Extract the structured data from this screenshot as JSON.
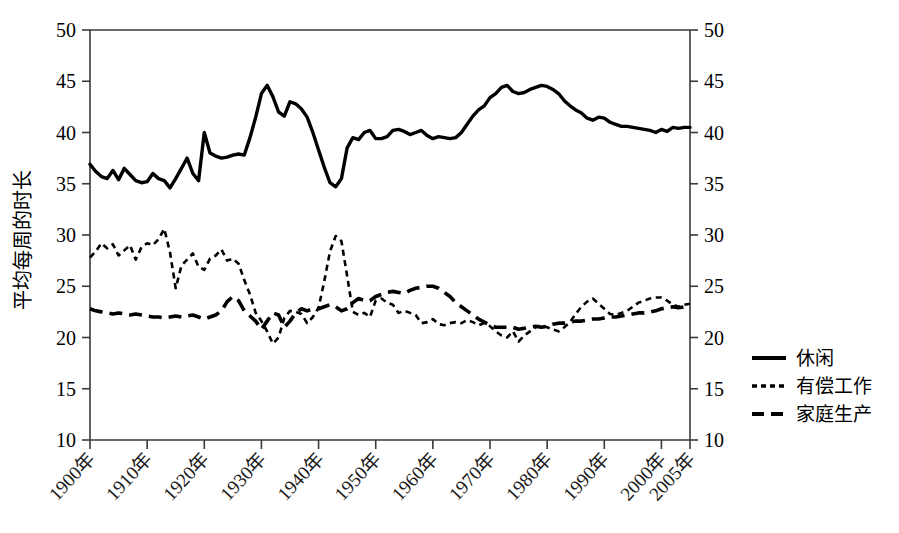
{
  "chart_data": {
    "type": "line",
    "title": "",
    "xlabel": "",
    "ylabel": "平均每周的时长",
    "ylim": [
      10,
      50
    ],
    "xlim": [
      1900,
      2005
    ],
    "y_ticks": [
      10,
      15,
      20,
      25,
      30,
      35,
      40,
      45,
      50
    ],
    "y_tick_labels_left": [
      "10",
      "15",
      "20",
      "25",
      "30",
      "35",
      "40",
      "45",
      "50"
    ],
    "y_tick_labels_right": [
      "10",
      "15",
      "20",
      "25",
      "30",
      "35",
      "40",
      "45",
      "50"
    ],
    "x_ticks": [
      1900,
      1910,
      1920,
      1930,
      1940,
      1950,
      1960,
      1970,
      1980,
      1990,
      2000,
      2005
    ],
    "x_tick_labels": [
      "1900年",
      "1910年",
      "1920年",
      "1930年",
      "1940年",
      "1950年",
      "1960年",
      "1970年",
      "1980年",
      "1990年",
      "2000年",
      "2005年"
    ],
    "grid": false,
    "dual_y_axis": true,
    "legend_position": "right",
    "series": [
      {
        "name": "休闲",
        "style": "solid",
        "x": [
          1900,
          1901,
          1902,
          1903,
          1904,
          1905,
          1906,
          1907,
          1908,
          1909,
          1910,
          1911,
          1912,
          1913,
          1914,
          1915,
          1916,
          1917,
          1918,
          1919,
          1920,
          1921,
          1922,
          1923,
          1924,
          1925,
          1926,
          1927,
          1928,
          1929,
          1930,
          1931,
          1932,
          1933,
          1934,
          1935,
          1936,
          1937,
          1938,
          1939,
          1940,
          1941,
          1942,
          1943,
          1944,
          1945,
          1946,
          1947,
          1948,
          1949,
          1950,
          1951,
          1952,
          1953,
          1954,
          1955,
          1956,
          1957,
          1958,
          1959,
          1960,
          1961,
          1962,
          1963,
          1964,
          1965,
          1966,
          1967,
          1968,
          1969,
          1970,
          1971,
          1972,
          1973,
          1974,
          1975,
          1976,
          1977,
          1978,
          1979,
          1980,
          1981,
          1982,
          1983,
          1984,
          1985,
          1986,
          1987,
          1988,
          1989,
          1990,
          1991,
          1992,
          1993,
          1994,
          1995,
          1996,
          1997,
          1998,
          1999,
          2000,
          2001,
          2002,
          2003,
          2004,
          2005
        ],
        "values": [
          36.9,
          36.2,
          35.7,
          35.5,
          36.3,
          35.4,
          36.5,
          35.9,
          35.3,
          35.1,
          35.2,
          36.0,
          35.5,
          35.3,
          34.6,
          35.5,
          36.5,
          37.5,
          36.0,
          35.3,
          40.0,
          38.0,
          37.7,
          37.5,
          37.6,
          37.8,
          37.9,
          37.8,
          39.5,
          41.5,
          43.8,
          44.6,
          43.5,
          42.0,
          41.6,
          43.0,
          42.8,
          42.3,
          41.5,
          40.0,
          38.3,
          36.6,
          35.1,
          34.7,
          35.5,
          38.5,
          39.5,
          39.3,
          40.0,
          40.2,
          39.4,
          39.4,
          39.6,
          40.2,
          40.3,
          40.1,
          39.8,
          40.0,
          40.2,
          39.7,
          39.4,
          39.6,
          39.5,
          39.4,
          39.5,
          40.0,
          40.8,
          41.6,
          42.2,
          42.6,
          43.4,
          43.8,
          44.4,
          44.6,
          44.0,
          43.8,
          43.9,
          44.2,
          44.4,
          44.6,
          44.5,
          44.2,
          43.8,
          43.1,
          42.6,
          42.2,
          41.9,
          41.4,
          41.2,
          41.5,
          41.4,
          41.0,
          40.8,
          40.6,
          40.6,
          40.5,
          40.4,
          40.3,
          40.2,
          40.0,
          40.3,
          40.1,
          40.5,
          40.4,
          40.5,
          40.5
        ]
      },
      {
        "name": "有偿工作",
        "style": "dotted",
        "x": [
          1900,
          1901,
          1902,
          1903,
          1904,
          1905,
          1906,
          1907,
          1908,
          1909,
          1910,
          1911,
          1912,
          1913,
          1914,
          1915,
          1916,
          1917,
          1918,
          1919,
          1920,
          1921,
          1922,
          1923,
          1924,
          1925,
          1926,
          1927,
          1928,
          1929,
          1930,
          1931,
          1932,
          1933,
          1934,
          1935,
          1936,
          1937,
          1938,
          1939,
          1940,
          1941,
          1942,
          1943,
          1944,
          1945,
          1946,
          1947,
          1948,
          1949,
          1950,
          1951,
          1952,
          1953,
          1954,
          1955,
          1956,
          1957,
          1958,
          1959,
          1960,
          1961,
          1962,
          1963,
          1964,
          1965,
          1966,
          1967,
          1968,
          1969,
          1970,
          1971,
          1972,
          1973,
          1974,
          1975,
          1976,
          1977,
          1978,
          1979,
          1980,
          1981,
          1982,
          1983,
          1984,
          1985,
          1986,
          1987,
          1988,
          1989,
          1990,
          1991,
          1992,
          1993,
          1994,
          1995,
          1996,
          1997,
          1998,
          1999,
          2000,
          2001,
          2002,
          2003,
          2004,
          2005
        ],
        "values": [
          27.8,
          28.4,
          29.2,
          28.7,
          29.1,
          28.0,
          28.5,
          29.0,
          27.6,
          28.8,
          29.2,
          29.0,
          29.6,
          30.6,
          28.3,
          24.8,
          27.0,
          27.6,
          28.2,
          26.9,
          26.6,
          27.7,
          28.0,
          28.6,
          27.5,
          27.7,
          27.2,
          25.6,
          24.2,
          22.4,
          21.6,
          20.6,
          19.4,
          20.0,
          21.9,
          22.6,
          22.5,
          22.3,
          21.4,
          22.0,
          22.9,
          25.5,
          28.4,
          29.9,
          29.4,
          26.0,
          22.5,
          22.2,
          22.4,
          22.0,
          23.6,
          23.8,
          23.4,
          23.2,
          22.4,
          22.6,
          22.4,
          22.2,
          21.4,
          21.5,
          21.8,
          21.3,
          21.2,
          21.4,
          21.5,
          21.4,
          21.7,
          21.5,
          21.2,
          21.4,
          21.1,
          20.6,
          20.2,
          20.0,
          20.6,
          19.6,
          20.2,
          20.6,
          21.0,
          21.2,
          21.0,
          20.8,
          20.6,
          21.0,
          21.5,
          22.3,
          23.0,
          23.5,
          23.8,
          23.3,
          22.8,
          22.3,
          22.2,
          22.4,
          22.6,
          23.0,
          23.4,
          23.6,
          23.8,
          23.9,
          23.9,
          23.6,
          23.2,
          23.0,
          23.2,
          23.3
        ]
      },
      {
        "name": "家庭生产",
        "style": "dashed",
        "x": [
          1900,
          1901,
          1902,
          1903,
          1904,
          1905,
          1906,
          1907,
          1908,
          1909,
          1910,
          1911,
          1912,
          1913,
          1914,
          1915,
          1916,
          1917,
          1918,
          1919,
          1920,
          1921,
          1922,
          1923,
          1924,
          1925,
          1926,
          1927,
          1928,
          1929,
          1930,
          1931,
          1932,
          1933,
          1934,
          1935,
          1936,
          1937,
          1938,
          1939,
          1940,
          1941,
          1942,
          1943,
          1944,
          1945,
          1946,
          1947,
          1948,
          1949,
          1950,
          1951,
          1952,
          1953,
          1954,
          1955,
          1956,
          1957,
          1958,
          1959,
          1960,
          1961,
          1962,
          1963,
          1964,
          1965,
          1966,
          1967,
          1968,
          1969,
          1970,
          1971,
          1972,
          1973,
          1974,
          1975,
          1976,
          1977,
          1978,
          1979,
          1980,
          1981,
          1982,
          1983,
          1984,
          1985,
          1986,
          1987,
          1988,
          1989,
          1990,
          1991,
          1992,
          1993,
          1994,
          1995,
          1996,
          1997,
          1998,
          1999,
          2000,
          2001,
          2002,
          2003,
          2004,
          2005
        ],
        "values": [
          22.8,
          22.6,
          22.5,
          22.4,
          22.3,
          22.4,
          22.3,
          22.2,
          22.3,
          22.2,
          22.1,
          22.0,
          22.0,
          21.9,
          22.0,
          22.1,
          22.0,
          22.1,
          22.2,
          22.0,
          21.8,
          22.0,
          22.2,
          22.6,
          23.5,
          24.0,
          23.6,
          22.6,
          22.1,
          21.6,
          20.8,
          21.6,
          22.4,
          22.2,
          21.0,
          21.6,
          22.4,
          22.8,
          22.6,
          22.8,
          22.8,
          23.0,
          23.2,
          23.0,
          22.6,
          22.8,
          23.4,
          23.8,
          23.6,
          23.6,
          24.0,
          24.2,
          24.4,
          24.5,
          24.4,
          24.3,
          24.6,
          24.8,
          24.9,
          25.0,
          25.0,
          24.8,
          24.4,
          24.0,
          23.4,
          23.0,
          22.6,
          22.2,
          21.8,
          21.5,
          21.2,
          21.0,
          21.0,
          21.0,
          21.0,
          20.8,
          20.9,
          21.0,
          21.1,
          21.0,
          21.1,
          21.3,
          21.4,
          21.4,
          21.5,
          21.6,
          21.6,
          21.7,
          21.8,
          21.8,
          21.9,
          22.0,
          22.0,
          22.1,
          22.2,
          22.3,
          22.4,
          22.4,
          22.5,
          22.6,
          22.8,
          22.9,
          23.0,
          22.9,
          23.0,
          23.0
        ]
      }
    ]
  },
  "axis": {
    "ylabel": "平均每周的时长"
  },
  "legend": {
    "items": [
      {
        "label": "休闲",
        "style": "solid"
      },
      {
        "label": "有偿工作",
        "style": "dotted"
      },
      {
        "label": "家庭生产",
        "style": "dashed"
      }
    ]
  },
  "colors": {
    "line": "#000000",
    "axis": "#3a3a3a",
    "background": "#ffffff"
  }
}
